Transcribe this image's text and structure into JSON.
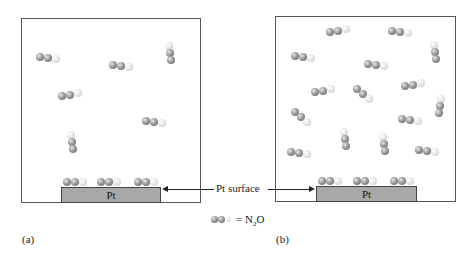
{
  "panels": [
    {
      "id": "a",
      "caption": "(a)",
      "plate_label": "Pt"
    },
    {
      "id": "b",
      "caption": "(b)",
      "plate_label": "Pt"
    }
  ],
  "annotation": {
    "text": "Pt surface"
  },
  "legend": {
    "formula_prefix": "= N",
    "subscript": "2",
    "formula_suffix": "O",
    "meaning": "N2O molecule: two nitrogen atoms (dark gray) and one oxygen atom (light gray)"
  },
  "colors": {
    "nitrogen": "#8a8a8a",
    "oxygen": "#d9d9d9",
    "plate": "#a8a8a8",
    "border": "#555555"
  },
  "molecules": {
    "panel_a_gas": 6,
    "panel_a_adsorbed": 3,
    "panel_b_gas": 16,
    "panel_b_adsorbed": 3
  }
}
